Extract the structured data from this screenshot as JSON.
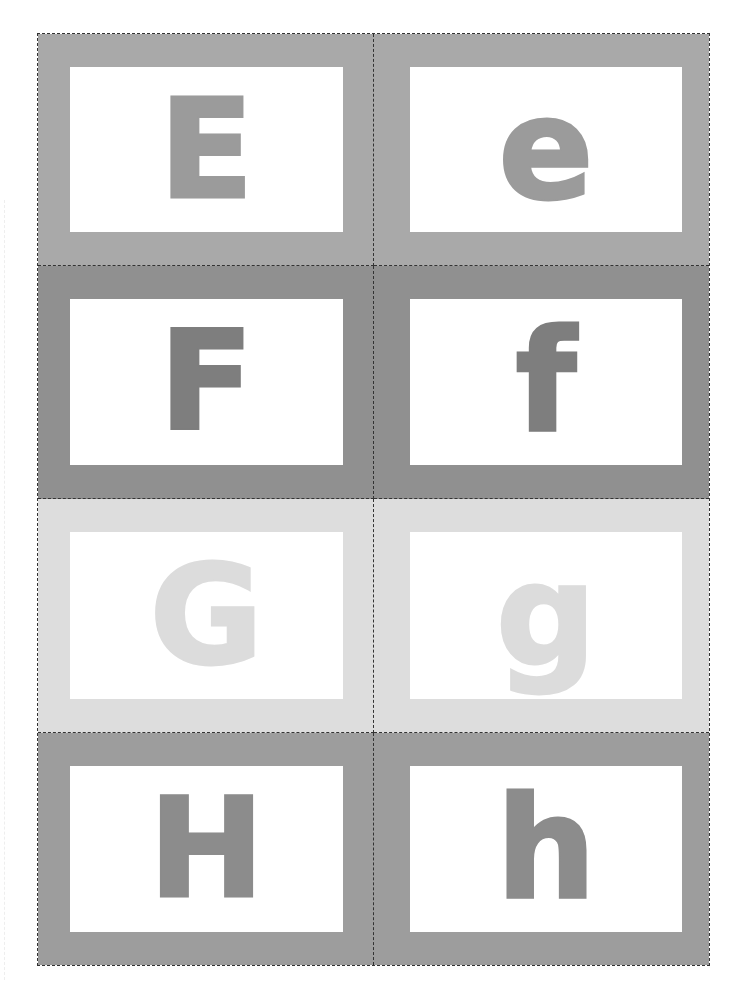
{
  "sheet": {
    "title": "Letter flashcards E-H",
    "cut_line_style": "dashed",
    "rows": [
      {
        "bg_color": "#a9a9a9",
        "letter_color": "#9b9b9b",
        "cards": [
          {
            "letter": "E",
            "case": "upper"
          },
          {
            "letter": "e",
            "case": "lower"
          }
        ]
      },
      {
        "bg_color": "#909090",
        "letter_color": "#7e7e7e",
        "cards": [
          {
            "letter": "F",
            "case": "upper"
          },
          {
            "letter": "f",
            "case": "lower"
          }
        ]
      },
      {
        "bg_color": "#dddddd",
        "letter_color": "#dcdcdc",
        "cards": [
          {
            "letter": "G",
            "case": "upper"
          },
          {
            "letter": "g",
            "case": "lower"
          }
        ]
      },
      {
        "bg_color": "#9d9d9d",
        "letter_color": "#8c8c8c",
        "cards": [
          {
            "letter": "H",
            "case": "upper"
          },
          {
            "letter": "h",
            "case": "lower"
          }
        ]
      }
    ]
  }
}
